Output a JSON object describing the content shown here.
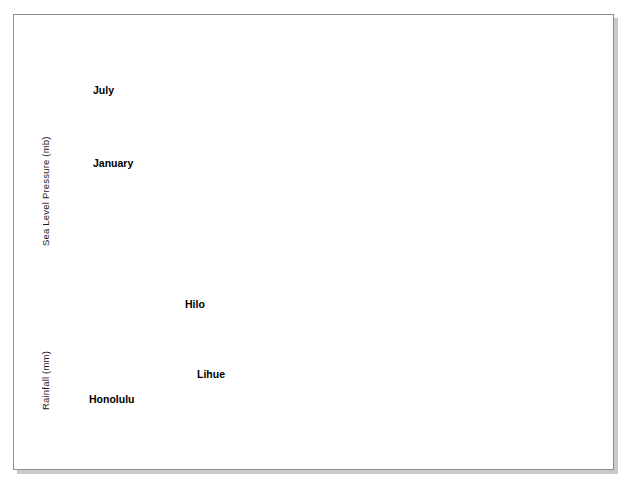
{
  "figure": {
    "background_color": "#ffffff",
    "panel_color": "#e8e8e8",
    "line_color": "#000000",
    "mean_line_color": "#555555",
    "frame_color": "#8e8e8e"
  },
  "axes": {
    "pressure_axis_title": "Sea Level Pressure (mb)",
    "rainfall_axis_title": "Rainfall (mm)",
    "xticks": [
      "1880",
      "1895",
      "1910",
      "1925",
      "1940",
      "1955",
      "1970",
      "1985"
    ],
    "july_yticks": [
      "1018",
      "1017",
      "1016",
      "1015"
    ],
    "january_yticks": [
      "1017",
      "1016",
      "1015",
      "1014",
      "1013",
      "1012"
    ],
    "rainfall_yticks": [
      "4500",
      "3000",
      "1500",
      "0"
    ]
  },
  "labels": {
    "july": "July",
    "january": "January",
    "hilo": "Hilo",
    "lihue": "Lihue",
    "honolulu": "Honolulu"
  },
  "chart_data": {
    "type": "line",
    "title": "",
    "xlabel": "",
    "grid": true,
    "legend": "inline-labels",
    "panels": [
      {
        "name": "july-pressure",
        "ylabel": "Sea Level Pressure (mb)",
        "ylim": [
          1014.7,
          1018.2
        ],
        "xlim": [
          1880,
          1985
        ],
        "yticks": [
          1018,
          1017,
          1016,
          1015
        ],
        "mean_line": 1016.4,
        "series": [
          {
            "name": "July",
            "x_start": 1881,
            "x_end": 1980,
            "values": [
              1016.45,
              1016.4,
              1016.2,
              1016.0,
              1015.95,
              1016.05,
              1015.9,
              1016.0,
              1015.85,
              1015.85,
              1015.95,
              1016.1,
              1016.35,
              1016.6,
              1016.8,
              1016.85,
              1016.85,
              1016.95,
              1016.85,
              1016.8,
              1016.6,
              1016.35,
              1016.1,
              1015.9,
              1015.8,
              1015.75,
              1015.7,
              1015.7,
              1015.65,
              1015.6,
              1015.55,
              1015.55,
              1015.75,
              1016.15,
              1016.4,
              1016.45,
              1016.4,
              1016.3,
              1016.0,
              1016.15,
              1016.3,
              1016.15,
              1016.1,
              1016.1,
              1016.05,
              1015.95,
              1015.85,
              1015.8,
              1015.9,
              1016.05,
              1016.1,
              1016.1,
              1016.05,
              1016.1,
              1016.2,
              1016.35,
              1016.55,
              1016.4,
              1016.35,
              1016.5,
              1016.6,
              1016.55,
              1016.4,
              1016.4,
              1016.55,
              1016.75,
              1016.85,
              1016.9,
              1016.85,
              1016.8,
              1016.7,
              1016.6,
              1016.7,
              1016.6,
              1016.75,
              1016.7,
              1016.75,
              1016.55,
              1016.5,
              1016.5,
              1016.5,
              1016.45,
              1016.4,
              1016.4,
              1016.35,
              1016.2,
              1016.05,
              1015.95,
              1015.95,
              1016.0,
              1016.1,
              1016.3,
              1016.5,
              1016.7,
              1016.75,
              1016.75,
              1016.65,
              1016.4,
              1016.35,
              1016.45
            ]
          }
        ]
      },
      {
        "name": "january-pressure",
        "ylabel": "Sea Level Pressure (mb)",
        "ylim": [
          1011.6,
          1017.4
        ],
        "xlim": [
          1880,
          1985
        ],
        "yticks": [
          1017,
          1016,
          1015,
          1014,
          1013,
          1012
        ],
        "mean_line": 1015.5,
        "series": [
          {
            "name": "January",
            "x_start": 1881,
            "x_end": 1981,
            "values": [
              1015.9,
              1015.6,
              1015.7,
              1015.55,
              1015.6,
              1015.4,
              1015.2,
              1015.05,
              1015.2,
              1015.0,
              1014.9,
              1014.85,
              1014.85,
              1014.9,
              1015.05,
              1015.35,
              1015.4,
              1015.55,
              1015.9,
              1016.2,
              1016.5,
              1016.6,
              1016.6,
              1016.45,
              1016.3,
              1015.85,
              1015.5,
              1015.65,
              1015.9,
              1016.05,
              1015.95,
              1016.35,
              1016.1,
              1015.9,
              1016.0,
              1015.85,
              1015.6,
              1015.45,
              1015.4,
              1015.35,
              1015.4,
              1015.1,
              1014.7,
              1015.1,
              1014.95,
              1015.4,
              1015.35,
              1016.1,
              1016.15,
              1016.1,
              1016.2,
              1015.6,
              1015.55,
              1015.5,
              1015.6,
              1015.55,
              1015.5,
              1015.85,
              1015.55,
              1015.6,
              1015.65,
              1015.6,
              1015.55,
              1015.6,
              1015.45,
              1015.5,
              1015.25,
              1014.9,
              1014.6,
              1015.0,
              1014.7,
              1014.9,
              1014.85,
              1014.6,
              1014.4,
              1014.0,
              1013.9,
              1013.4,
              1012.8,
              1012.2,
              1013.0,
              1013.6,
              1014.2,
              1014.5,
              1014.7,
              1015.0,
              1015.3,
              1015.15,
              1015.1,
              1015.2,
              1015.2,
              1015.4,
              1015.3,
              1015.35,
              1015.45,
              1015.5,
              1015.55,
              1015.6,
              1015.5,
              1015.4,
              1015.6
            ]
          }
        ]
      },
      {
        "name": "rainfall",
        "ylabel": "Rainfall (mm)",
        "ylim": [
          0,
          4800
        ],
        "xlim": [
          1880,
          1985
        ],
        "yticks": [
          4500,
          3000,
          1500,
          0
        ],
        "series": [
          {
            "name": "Hilo",
            "mean_line": 3400,
            "x_start": 1905,
            "x_end": 1980,
            "values": [
              3280,
              3200,
              3260,
              3180,
              3180,
              3180,
              3190,
              3400,
              3320,
              3450,
              3600,
              3560,
              3640,
              3580,
              3420,
              3320,
              3620,
              3300,
              3320,
              3320,
              3380,
              3560,
              3680,
              3840,
              3980,
              3880,
              3620,
              3480,
              3400,
              3120,
              3000,
              3140,
              3240,
              3000,
              3020,
              3240,
              3620,
              4050,
              4300,
              3900,
              3680,
              3460,
              3420,
              3400,
              3500,
              3150,
              3080,
              3150,
              3120,
              3320,
              3400,
              3280,
              3450,
              3520,
              3420,
              3580,
              3680,
              3560,
              3620,
              3440,
              3280,
              3020,
              3180,
              3100,
              3420,
              3520,
              3680,
              3800,
              4000,
              3860,
              3520,
              3280,
              3050,
              2960,
              3000,
              3240
            ]
          },
          {
            "name": "Lihue",
            "mean_line": 1280,
            "x_start": 1905,
            "x_end": 1980,
            "values": [
              1180,
              1160,
              1140,
              1180,
              1100,
              1180,
              1300,
              1380,
              1460,
              1540,
              1600,
              1560,
              1520,
              1460,
              1440,
              1440,
              1440,
              1320,
              1200,
              1060,
              1120,
              1180,
              1080,
              1180,
              1220,
              1280,
              1300,
              1320,
              1360,
              1360,
              1340,
              1320,
              1300,
              1260,
              1240,
              1240,
              1240,
              1320,
              1380,
              1320,
              1280,
              1280,
              1280,
              1300,
              1300,
              1260,
              1300,
              1320,
              1320,
              1340,
              1360,
              1340,
              1400,
              1460,
              1420,
              1300,
              1200,
              1320,
              1380,
              1420,
              1500,
              1560,
              1460,
              1400,
              1340,
              1360,
              1300,
              1160,
              1180,
              1200,
              1220,
              1200,
              1360,
              1300,
              1240,
              1260
            ]
          },
          {
            "name": "Honolulu",
            "mean_line": 670,
            "x_start": 1880,
            "x_end": 1980,
            "values": [
              700,
              690,
              660,
              680,
              640,
              680,
              690,
              660,
              700,
              720,
              740,
              760,
              740,
              720,
              730,
              720,
              700,
              680,
              700,
              670,
              690,
              660,
              640,
              620,
              600,
              590,
              600,
              620,
              660,
              700,
              760,
              820,
              800,
              760,
              720,
              700,
              720,
              700,
              680,
              700,
              720,
              720,
              760,
              860,
              900,
              880,
              840,
              780,
              720,
              680,
              660,
              680,
              700,
              680,
              700,
              720,
              700,
              680,
              700,
              720,
              700,
              680,
              660,
              680,
              660,
              700,
              720,
              760,
              800,
              840,
              860,
              840,
              800,
              780,
              760,
              740,
              760,
              780,
              760,
              720,
              700,
              680,
              660,
              640,
              620,
              600,
              620,
              640,
              620,
              600,
              620,
              640,
              660,
              680,
              660,
              640,
              700,
              660,
              620,
              640,
              620
            ]
          }
        ]
      }
    ]
  }
}
